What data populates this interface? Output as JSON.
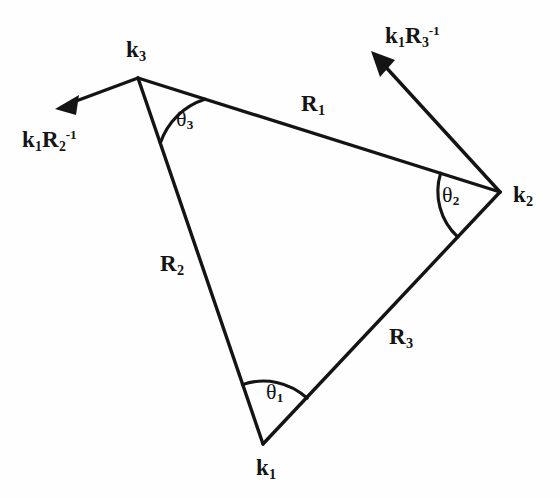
{
  "figure": {
    "kind": "geometry-diagram",
    "background_color": "#fefefe",
    "ink_color": "#141414"
  },
  "vertices": [
    {
      "id": "k1",
      "label_base": "k",
      "label_sub": "1",
      "x": 263,
      "y": 444,
      "label_x": 256,
      "label_y": 456
    },
    {
      "id": "k2",
      "label_base": "k",
      "label_sub": "2",
      "x": 500,
      "y": 192,
      "label_x": 513,
      "label_y": 183
    },
    {
      "id": "k3",
      "label_base": "k",
      "label_sub": "3",
      "x": 138,
      "y": 78,
      "label_x": 126,
      "label_y": 38
    }
  ],
  "sides": [
    {
      "id": "R1",
      "label_base": "R",
      "label_sub": "1",
      "from": "k3",
      "to": "k2",
      "label_x": 301,
      "label_y": 92
    },
    {
      "id": "R2",
      "label_base": "R",
      "label_sub": "2",
      "from": "k3",
      "to": "k1",
      "label_x": 160,
      "label_y": 252
    },
    {
      "id": "R3",
      "label_base": "R",
      "label_sub": "3",
      "from": "k1",
      "to": "k2",
      "label_x": 389,
      "label_y": 325
    }
  ],
  "angles": [
    {
      "id": "theta1",
      "label_base": "θ",
      "label_sub": "1",
      "at": "k1",
      "label_x": 266,
      "label_y": 381
    },
    {
      "id": "theta2",
      "label_base": "θ",
      "label_sub": "2",
      "at": "k2",
      "label_x": 442,
      "label_y": 184
    },
    {
      "id": "theta3",
      "label_base": "θ",
      "label_sub": "3",
      "at": "k3",
      "label_x": 176,
      "label_y": 108
    }
  ],
  "vectors": [
    {
      "id": "k1R2inv",
      "label_base": "k",
      "label_sub": "1",
      "label_base2": "R",
      "label_sub2": "2",
      "label_sup2": "-1",
      "from_x": 138,
      "from_y": 78,
      "to_x": 58,
      "to_y": 108,
      "label_x": 22,
      "label_y": 128
    },
    {
      "id": "k1R3inv",
      "label_base": "k",
      "label_sub": "1",
      "label_base2": "R",
      "label_sub2": "3",
      "label_sup2": "-1",
      "from_x": 500,
      "from_y": 192,
      "to_x": 373,
      "to_y": 53,
      "label_x": 385,
      "label_y": 24
    }
  ]
}
